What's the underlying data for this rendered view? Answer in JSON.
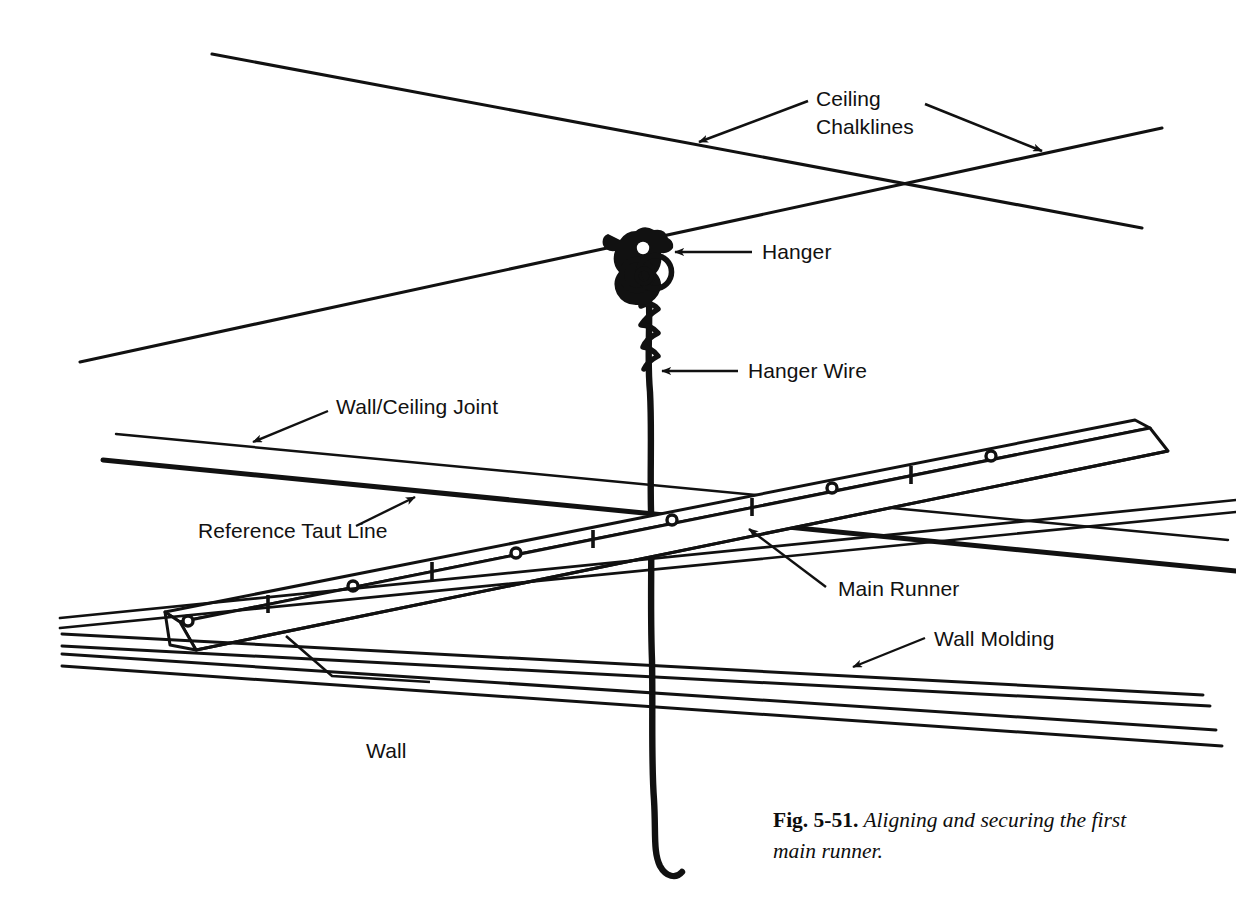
{
  "figure": {
    "domain": "technical-illustration",
    "background_color": "#ffffff",
    "ink_color": "#111111"
  },
  "caption": {
    "fig_number": "Fig. 5-51.",
    "text": " Aligning and securing the first main runner.",
    "full": "Fig. 5-51. Aligning and securing the first main runner."
  },
  "labels": {
    "ceiling_chalklines_line1": "Ceiling",
    "ceiling_chalklines_line2": "Chalklines",
    "hanger": "Hanger",
    "hanger_wire": "Hanger Wire",
    "wall_ceiling_joint": "Wall/Ceiling Joint",
    "reference_taut_line": "Reference Taut Line",
    "main_runner": "Main Runner",
    "wall_molding": "Wall Molding",
    "wall": "Wall"
  },
  "parts": [
    {
      "id": "ceiling-chalklines",
      "name": "Ceiling Chalklines",
      "count": 2,
      "description": "Two crossing snapped chalk lines on the ceiling"
    },
    {
      "id": "hanger",
      "name": "Hanger",
      "description": "Wire hanger clip at the chalkline intersection"
    },
    {
      "id": "hanger-wire",
      "name": "Hanger Wire",
      "description": "Twisted vertical wire dropping from the hanger"
    },
    {
      "id": "wall-ceiling-joint",
      "name": "Wall/Ceiling Joint",
      "description": "Line where the wall meets the ceiling"
    },
    {
      "id": "reference-taut-line",
      "name": "Reference Taut Line",
      "description": "Taut string stretched across the room as a height reference"
    },
    {
      "id": "main-runner",
      "name": "Main Runner",
      "description": "Inverted-T main runner with hanger holes and cross-tee slots"
    },
    {
      "id": "wall-molding",
      "name": "Wall Molding",
      "description": "L-shaped wall angle molding around the perimeter"
    },
    {
      "id": "wall",
      "name": "Wall",
      "description": "Room wall surface"
    }
  ],
  "runner_features": {
    "round_holes": 5,
    "slots": 5,
    "note": "Round hanger-wire holes and vertical cross-tee slots alternate along the runner web"
  }
}
